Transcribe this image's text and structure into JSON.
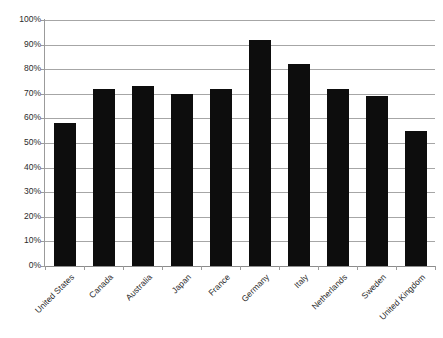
{
  "chart_data": {
    "type": "bar",
    "title": "",
    "subtitle": "",
    "xlabel": "",
    "ylabel": "",
    "ylim": [
      0,
      100
    ],
    "ytick_labels": [
      "100%",
      "90%",
      "80%",
      "70%",
      "60%",
      "50%",
      "40%",
      "30%",
      "20%",
      "10%",
      "0%"
    ],
    "ytick_values": [
      100,
      90,
      80,
      70,
      60,
      50,
      40,
      30,
      20,
      10,
      0
    ],
    "grid": true,
    "legend": false,
    "legend_position": "none",
    "bar_color": "#0d0d0d",
    "gridline_color": "#a6a6a6",
    "axis_color": "#9b9b9b",
    "categories": [
      "United States",
      "Canada",
      "Australia",
      "Japan",
      "France",
      "Germany",
      "Italy",
      "Netherlands",
      "Sweden",
      "United Kingdom"
    ],
    "values": [
      58,
      72,
      73,
      70,
      72,
      92,
      82,
      72,
      69,
      55
    ],
    "value_labels": [
      "58%",
      "72%",
      "73%",
      "70%",
      "72%",
      "92%",
      "82%",
      "72%",
      "69%",
      "55%"
    ],
    "annotations": []
  }
}
